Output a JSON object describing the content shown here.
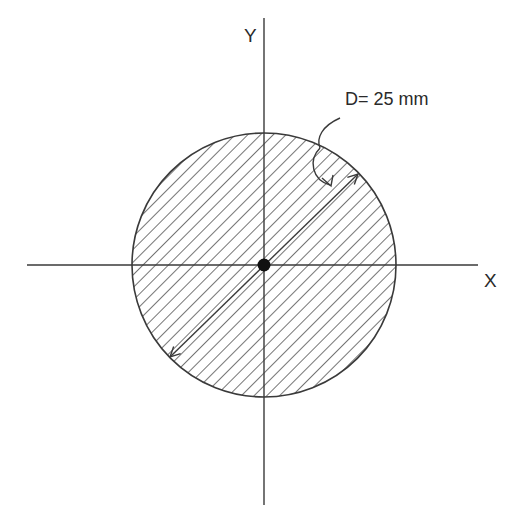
{
  "diagram": {
    "axes": {
      "x_label": "X",
      "y_label": "Y"
    },
    "section": {
      "shape": "circle",
      "fill": "diagonal hatching",
      "center_marker": "centroid-dot"
    },
    "dimension": {
      "label": "D= 25 mm",
      "type": "diameter"
    },
    "colors": {
      "stroke": "#3a3a3a",
      "background": "#ffffff"
    }
  }
}
